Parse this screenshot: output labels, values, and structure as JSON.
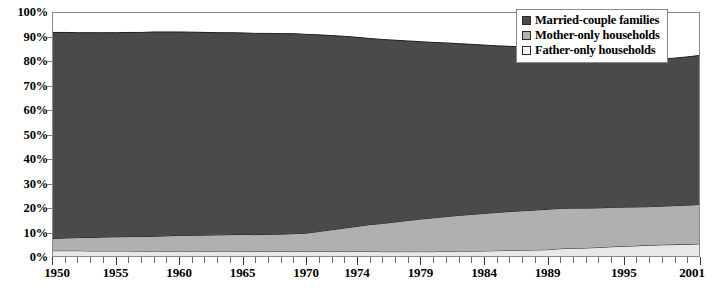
{
  "chart_data": {
    "type": "area",
    "stacked": true,
    "title": "",
    "subtitle": "",
    "xlabel": "",
    "ylabel": "",
    "ylim": [
      0,
      100
    ],
    "ytick_labels": [
      "0%",
      "10%",
      "20%",
      "30%",
      "40%",
      "50%",
      "60%",
      "70%",
      "80%",
      "90%",
      "100%"
    ],
    "ytick_values": [
      0,
      10,
      20,
      30,
      40,
      50,
      60,
      70,
      80,
      90,
      100
    ],
    "grid": false,
    "legend_position": "top-right",
    "xtick_labels": [
      "1950",
      "1955",
      "1960",
      "1965",
      "1970",
      "1974",
      "1979",
      "1984",
      "1989",
      "1995",
      "2001"
    ],
    "xtick_values": [
      1950,
      1955,
      1960,
      1965,
      1970,
      1974,
      1979,
      1984,
      1989,
      1995,
      2001
    ],
    "x": [
      1950,
      1951,
      1952,
      1953,
      1954,
      1955,
      1956,
      1957,
      1958,
      1959,
      1960,
      1961,
      1962,
      1963,
      1964,
      1965,
      1966,
      1967,
      1968,
      1969,
      1970,
      1971,
      1972,
      1973,
      1974,
      1975,
      1976,
      1977,
      1978,
      1979,
      1980,
      1981,
      1982,
      1983,
      1984,
      1985,
      1986,
      1987,
      1988,
      1989,
      1990,
      1991,
      1992,
      1993,
      1994,
      1995,
      1996,
      1997,
      1998,
      1999,
      2000,
      2001
    ],
    "series": [
      {
        "name": "Father-only households",
        "color": "#e8e8e8",
        "values": [
          2.2,
          2.2,
          2.2,
          2.1,
          2.1,
          2.1,
          2.1,
          2.0,
          2.0,
          2.0,
          2.0,
          2.0,
          2.0,
          2.0,
          2.0,
          2.0,
          1.9,
          1.9,
          1.9,
          1.9,
          1.9,
          1.9,
          1.9,
          1.9,
          1.9,
          1.9,
          1.8,
          1.8,
          1.8,
          1.8,
          1.8,
          1.9,
          2.0,
          2.0,
          2.1,
          2.2,
          2.3,
          2.4,
          2.5,
          2.6,
          3.0,
          3.2,
          3.3,
          3.5,
          3.8,
          4.0,
          4.2,
          4.4,
          4.6,
          4.7,
          4.8,
          5.0
        ]
      },
      {
        "name": "Mother-only households",
        "color": "#b0b0b0",
        "values": [
          5.0,
          5.2,
          5.4,
          5.5,
          5.7,
          5.8,
          5.9,
          6.0,
          6.1,
          6.3,
          6.5,
          6.5,
          6.6,
          6.7,
          6.8,
          6.9,
          6.9,
          7.0,
          7.1,
          7.3,
          7.5,
          8.2,
          8.9,
          9.6,
          10.3,
          11.0,
          11.6,
          12.2,
          12.8,
          13.4,
          13.9,
          14.3,
          14.7,
          15.1,
          15.4,
          15.7,
          16.0,
          16.2,
          16.4,
          16.6,
          16.6,
          16.5,
          16.4,
          16.3,
          16.2,
          16.1,
          16.0,
          15.9,
          15.9,
          16.0,
          16.1,
          16.2
        ]
      },
      {
        "name": "Married-couple families",
        "color": "#4a4a4a",
        "values": [
          84.8,
          84.6,
          84.3,
          84.3,
          84.1,
          84.0,
          84.0,
          84.0,
          84.1,
          83.9,
          83.7,
          83.6,
          83.4,
          83.2,
          83.1,
          82.9,
          82.8,
          82.7,
          82.5,
          82.3,
          81.8,
          80.9,
          79.9,
          78.9,
          77.8,
          76.6,
          75.7,
          74.8,
          73.9,
          73.0,
          72.2,
          71.5,
          70.7,
          70.0,
          69.3,
          68.6,
          68.0,
          67.4,
          66.8,
          66.1,
          64.6,
          64.0,
          63.4,
          62.8,
          62.1,
          61.4,
          61.0,
          60.8,
          60.6,
          60.7,
          61.0,
          61.3
        ]
      }
    ],
    "stack_top_percent": [
      92.0,
      92.0,
      91.9,
      91.9,
      91.9,
      91.9,
      92.0,
      92.0,
      92.2,
      92.2,
      92.2,
      92.1,
      92.0,
      91.9,
      91.9,
      91.8,
      91.6,
      91.6,
      91.5,
      91.5,
      91.2,
      91.0,
      90.7,
      90.4,
      90.0,
      89.5,
      89.1,
      88.8,
      88.5,
      88.2,
      87.9,
      87.7,
      87.4,
      87.1,
      86.8,
      86.5,
      86.3,
      86.0,
      85.7,
      85.3,
      84.2,
      83.7,
      83.1,
      82.6,
      82.1,
      81.5,
      81.2,
      81.1,
      81.1,
      81.4,
      81.9,
      82.5
    ]
  },
  "legend": {
    "items": [
      {
        "label": "Married-couple families",
        "swatch": "#4a4a4a"
      },
      {
        "label": "Mother-only households",
        "swatch": "#b0b0b0"
      },
      {
        "label": "Father-only households",
        "swatch": "#f5f5f5"
      }
    ]
  }
}
